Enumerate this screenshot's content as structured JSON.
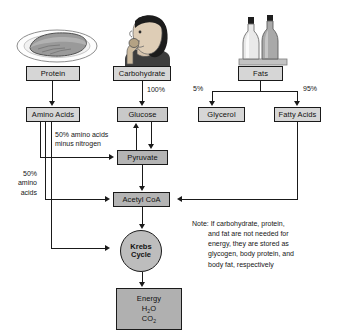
{
  "diagram": {
    "type": "flowchart",
    "colors": {
      "box_fill": "#c9c9c9",
      "box_fill_light": "#d6d6d6",
      "box_fill_dark": "#b4b4b4",
      "energy_fill": "#b0b0b0",
      "circle_fill": "#bdbdbd",
      "stroke": "#1a1a1a",
      "text": "#111111",
      "background": "#ffffff"
    }
  },
  "illustrations": [
    {
      "id": "steak-on-plate",
      "name": "steak-on-plate-illustration",
      "caption_for": "Protein"
    },
    {
      "id": "person-eating",
      "name": "person-eating-illustration",
      "caption_for": "Carbohydrate"
    },
    {
      "id": "oil-bottles",
      "name": "oil-bottles-illustration",
      "caption_for": "Fats"
    }
  ],
  "nodes": {
    "protein": "Protein",
    "carbohydrate": "Carbohydrate",
    "fats": "Fats",
    "amino_acids": "Amino Acids",
    "glucose": "Glucose",
    "glycerol": "Glycerol",
    "fatty_acids": "Fatty Acids",
    "pyruvate": "Pyruvate",
    "acetyl_coa": "Acetyl CoA",
    "krebs_line1": "Krebs",
    "krebs_line2": "Cycle",
    "energy_line1": "Energy",
    "energy_line2_pre": "H",
    "energy_line2_sub": "2",
    "energy_line2_post": "O",
    "energy_line3_pre": "CO",
    "energy_line3_sub": "2"
  },
  "edge_labels": {
    "carb_to_glucose": "100%",
    "fats_to_glycerol": "5%",
    "fats_to_fatty_acids": "95%",
    "amino_to_pyruvate_l1": "50% amino acids",
    "amino_to_pyruvate_l2": "minus nitrogen",
    "amino_left_l1": "50%",
    "amino_left_l2": "amino",
    "amino_left_l3": "acids"
  },
  "note": {
    "line1": "Note: If carbohydrate, protein,",
    "line2": "and fat are not needed for",
    "line3": "energy, they are stored as",
    "line4": "glycogen, body protein, and",
    "line5": "body fat, respectively"
  }
}
